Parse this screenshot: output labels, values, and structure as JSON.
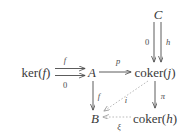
{
  "figure": {
    "kind": "commutative-diagram",
    "background_color": "#ffffff",
    "ink_color": "#3a3a3a",
    "width": 191,
    "height": 133
  },
  "nodes": {
    "ker_f": {
      "text": "ker(f)",
      "prefix": "ker(",
      "arg": "f",
      "suffix": ")",
      "x": 36,
      "y": 72
    },
    "A": {
      "text": "A",
      "x": 92,
      "y": 72
    },
    "coker_j": {
      "text": "coker(j)",
      "prefix": "coker(",
      "arg": "j",
      "suffix": ")",
      "x": 155,
      "y": 72
    },
    "C": {
      "text": "C",
      "x": 158,
      "y": 14
    },
    "B": {
      "text": "B",
      "x": 95,
      "y": 118
    },
    "coker_h": {
      "text": "coker(h)",
      "prefix": "coker(",
      "arg": "h",
      "suffix": ")",
      "x": 155,
      "y": 118
    }
  },
  "arrows": {
    "ker_to_A_top": {
      "label": "f",
      "style": "solid",
      "label_x": 65,
      "label_y": 60
    },
    "ker_to_A_bottom": {
      "label": "0",
      "style": "solid",
      "label_x": 65,
      "label_y": 85
    },
    "A_to_coker_j": {
      "label": "p",
      "style": "solid",
      "label_x": 118,
      "label_y": 61
    },
    "C_to_coker_j_left": {
      "label": "0",
      "style": "solid",
      "label_x": 147,
      "label_y": 42
    },
    "C_to_coker_j_right": {
      "label": "h",
      "style": "solid",
      "label_x": 168,
      "label_y": 42
    },
    "A_to_B": {
      "label": "f",
      "style": "solid",
      "label_x": 99,
      "label_y": 96
    },
    "coker_j_to_coker_h": {
      "label": "π",
      "style": "solid",
      "label_x": 163,
      "label_y": 96
    },
    "coker_j_to_B": {
      "label": "i",
      "style": "dashed",
      "label_x": 126,
      "label_y": 100
    },
    "coker_h_to_B": {
      "label": "ξ",
      "style": "dashed",
      "label_x": 119,
      "label_y": 127
    }
  }
}
